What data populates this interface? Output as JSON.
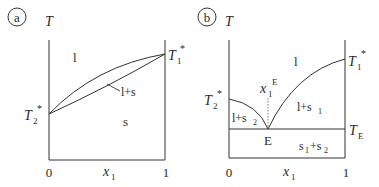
{
  "panel_a": {
    "tag": "a",
    "y_axis_label": "T",
    "x_axis_label": "x",
    "x_axis_label_sub": "1",
    "x_tick_left": "0",
    "x_tick_right": "1",
    "t1_label": "T",
    "t1_sub": "1",
    "t1_sup": "*",
    "t2_label": "T",
    "t2_sub": "2",
    "t2_sup": "*",
    "region_liquid": "l",
    "region_two_phase": "l+s",
    "region_solid": "s"
  },
  "panel_b": {
    "tag": "b",
    "y_axis_label": "T",
    "x_axis_label": "x",
    "x_axis_label_sub": "1",
    "x_tick_left": "0",
    "x_tick_right": "1",
    "t1_label": "T",
    "t1_sub": "1",
    "t1_sup": "*",
    "t2_label": "T",
    "t2_sub": "2",
    "t2_sup": "*",
    "te_label": "T",
    "te_sub": "E",
    "eutectic_comp_label": "x",
    "eutectic_comp_sub": "1",
    "eutectic_comp_sup": "E",
    "eutectic_point": "E",
    "region_liquid": "l",
    "region_l_s1": "l+s",
    "region_l_s1_sub": "1",
    "region_l_s2": "l+s",
    "region_l_s2_sub": "2",
    "region_s1_s2_a": "s",
    "region_s1_s2_a_sub": "1",
    "region_s1_s2_plus": "+s",
    "region_s1_s2_b_sub": "2"
  },
  "colors": {
    "line": "#333333",
    "text": "#2a2a2a"
  }
}
